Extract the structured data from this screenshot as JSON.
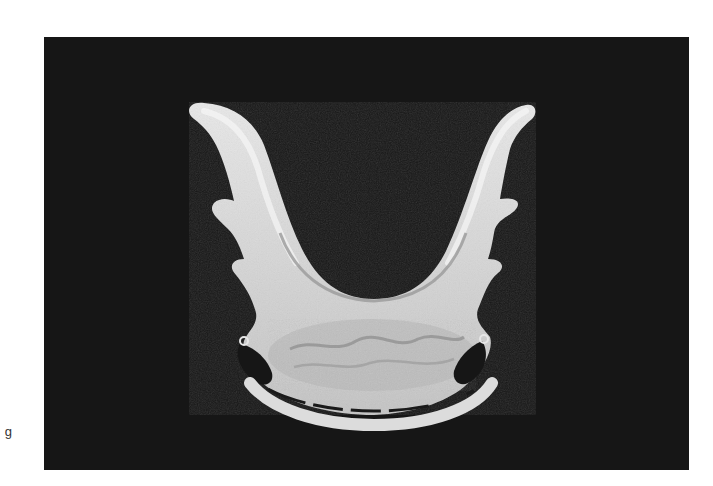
{
  "figure": {
    "edge_caption": "g",
    "photo": {
      "subject": "U-shaped dental appliance",
      "background_color": "#161616",
      "object_color_light": "#e6e6e6",
      "object_color_mid": "#bdbdbd",
      "object_color_shadow": "#8a8a8a"
    }
  }
}
